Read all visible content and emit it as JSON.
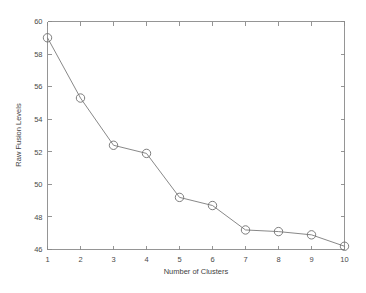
{
  "chart_data": {
    "type": "line",
    "title": "",
    "subtitle": "",
    "xlabel": "Number of Clusters",
    "ylabel": "Raw Fusion Levels",
    "x": [
      1,
      2,
      3,
      4,
      5,
      6,
      7,
      8,
      9,
      10
    ],
    "values": [
      59.0,
      55.3,
      52.4,
      51.9,
      49.2,
      48.7,
      47.2,
      47.1,
      46.9,
      46.2
    ],
    "series": [
      {
        "name": "Raw Fusion Levels",
        "values": [
          59.0,
          55.3,
          52.4,
          51.9,
          49.2,
          48.7,
          47.2,
          47.1,
          46.9,
          46.2
        ]
      }
    ],
    "xticks": [
      1,
      2,
      3,
      4,
      5,
      6,
      7,
      8,
      9,
      10
    ],
    "xtick_labels": [
      "1",
      "2",
      "3",
      "4",
      "5",
      "6",
      "7",
      "8",
      "9",
      "10"
    ],
    "yticks": [
      46,
      48,
      50,
      52,
      54,
      56,
      58,
      60
    ],
    "ytick_labels": [
      "46",
      "48",
      "50",
      "52",
      "54",
      "56",
      "58",
      "60"
    ],
    "xlim": [
      1,
      10
    ],
    "ylim": [
      46,
      60
    ],
    "grid": false,
    "legend": false,
    "legend_position": "none",
    "marker": "circle-open",
    "line_color": "#7a7a7a",
    "marker_color": "#6f6f6f",
    "axis_color": "#8a8a8a",
    "background_color": "#ffffff"
  },
  "figure": {
    "background_color": "#ffffff"
  }
}
